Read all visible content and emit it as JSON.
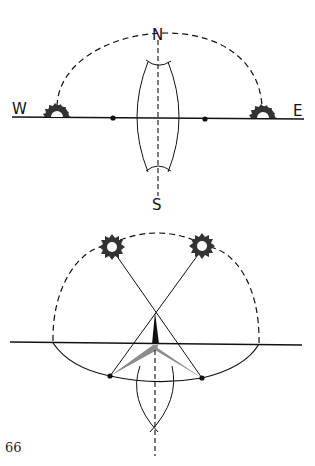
{
  "figure": {
    "top_diagram": {
      "description": "Finding north-south line from sunrise and sunset points on the horizon",
      "labels": {
        "west": "W",
        "east": "E",
        "north": "N",
        "south": "S"
      }
    },
    "bottom_diagram": {
      "description": "Shadow-tip method with gnomon and equal-length morning/afternoon shadows"
    },
    "page_number": "66"
  },
  "colors": {
    "ink": "#111111",
    "shadow_grey": "#8c8c8c",
    "background": "#ffffff"
  }
}
